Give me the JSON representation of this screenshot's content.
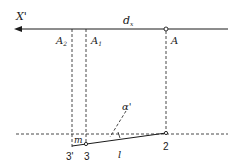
{
  "diagram": {
    "labels": {
      "x_axis": "X'",
      "d_x": "d",
      "d_x_sub": "x",
      "A2": "A",
      "A2_sub": "2",
      "A1": "A",
      "A1_sub": "1",
      "A": "A",
      "alpha": "α'",
      "m": "m",
      "p3prime": "3'",
      "p3": "3",
      "l": "l",
      "p2": "2"
    },
    "colors": {
      "stroke": "#1a1a1a",
      "background": "#ffffff"
    }
  }
}
